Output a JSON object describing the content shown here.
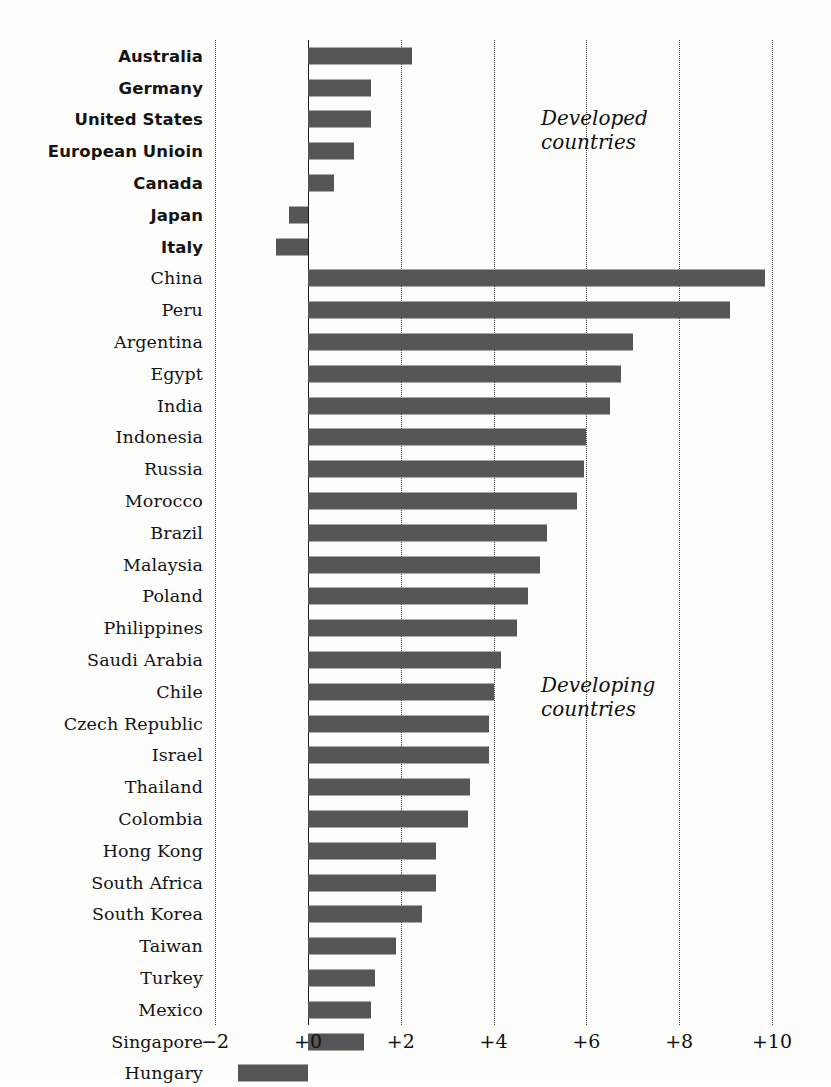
{
  "chart_data": {
    "type": "bar",
    "orientation": "horizontal",
    "title": "",
    "subtitle": "",
    "xlabel": "",
    "ylabel": "",
    "xlim": [
      -2,
      10
    ],
    "xticks": [
      -2,
      0,
      2,
      4,
      6,
      8,
      10
    ],
    "xtick_labels": [
      "−2",
      "+0",
      "+2",
      "+4",
      "+6",
      "+8",
      "+10"
    ],
    "grid": "vertical-dotted",
    "legend": "none",
    "bar_color": "#565656",
    "background_color": "#fdfdfc",
    "axis_color": "#1c1c1c",
    "annotations": [
      {
        "text": "Developed\ncountries",
        "group": "developed"
      },
      {
        "text": "Developing\ncountries",
        "group": "developing"
      }
    ],
    "groups": [
      {
        "name": "developed",
        "label": "Developed countries",
        "bold_labels": true
      },
      {
        "name": "developing",
        "label": "Developing countries",
        "bold_labels": false
      }
    ],
    "categories": [
      "Australia",
      "Germany",
      "United States",
      "European Unioin",
      "Canada",
      "Japan",
      "Italy",
      "China",
      "Peru",
      "Argentina",
      "Egypt",
      "India",
      "Indonesia",
      "Russia",
      "Morocco",
      "Brazil",
      "Malaysia",
      "Poland",
      "Philippines",
      "Saudi Arabia",
      "Chile",
      "Czech Republic",
      "Israel",
      "Thailand",
      "Colombia",
      "Hong Kong",
      "South Africa",
      "South Korea",
      "Taiwan",
      "Turkey",
      "Mexico",
      "Singapore",
      "Hungary"
    ],
    "values": [
      2.25,
      1.35,
      1.35,
      1.0,
      0.55,
      -0.4,
      -0.7,
      9.85,
      9.1,
      7.0,
      6.75,
      6.5,
      6.0,
      5.95,
      5.8,
      5.15,
      5.0,
      4.75,
      4.5,
      4.15,
      4.0,
      3.9,
      3.9,
      3.5,
      3.45,
      2.75,
      2.75,
      2.45,
      1.9,
      1.45,
      1.35,
      1.2,
      -1.5
    ],
    "rows": [
      {
        "label": "Australia",
        "value": 2.25,
        "group": "developed"
      },
      {
        "label": "Germany",
        "value": 1.35,
        "group": "developed"
      },
      {
        "label": "United States",
        "value": 1.35,
        "group": "developed"
      },
      {
        "label": "European Unioin",
        "value": 1.0,
        "group": "developed"
      },
      {
        "label": "Canada",
        "value": 0.55,
        "group": "developed"
      },
      {
        "label": "Japan",
        "value": -0.4,
        "group": "developed"
      },
      {
        "label": "Italy",
        "value": -0.7,
        "group": "developed"
      },
      {
        "label": "China",
        "value": 9.85,
        "group": "developing"
      },
      {
        "label": "Peru",
        "value": 9.1,
        "group": "developing"
      },
      {
        "label": "Argentina",
        "value": 7.0,
        "group": "developing"
      },
      {
        "label": "Egypt",
        "value": 6.75,
        "group": "developing"
      },
      {
        "label": "India",
        "value": 6.5,
        "group": "developing"
      },
      {
        "label": "Indonesia",
        "value": 6.0,
        "group": "developing"
      },
      {
        "label": "Russia",
        "value": 5.95,
        "group": "developing"
      },
      {
        "label": "Morocco",
        "value": 5.8,
        "group": "developing"
      },
      {
        "label": "Brazil",
        "value": 5.15,
        "group": "developing"
      },
      {
        "label": "Malaysia",
        "value": 5.0,
        "group": "developing"
      },
      {
        "label": "Poland",
        "value": 4.75,
        "group": "developing"
      },
      {
        "label": "Philippines",
        "value": 4.5,
        "group": "developing"
      },
      {
        "label": "Saudi Arabia",
        "value": 4.15,
        "group": "developing"
      },
      {
        "label": "Chile",
        "value": 4.0,
        "group": "developing"
      },
      {
        "label": "Czech Republic",
        "value": 3.9,
        "group": "developing"
      },
      {
        "label": "Israel",
        "value": 3.9,
        "group": "developing"
      },
      {
        "label": "Thailand",
        "value": 3.5,
        "group": "developing"
      },
      {
        "label": "Colombia",
        "value": 3.45,
        "group": "developing"
      },
      {
        "label": "Hong Kong",
        "value": 2.75,
        "group": "developing"
      },
      {
        "label": "South Africa",
        "value": 2.75,
        "group": "developing"
      },
      {
        "label": "South Korea",
        "value": 2.45,
        "group": "developing"
      },
      {
        "label": "Taiwan",
        "value": 1.9,
        "group": "developing"
      },
      {
        "label": "Turkey",
        "value": 1.45,
        "group": "developing"
      },
      {
        "label": "Mexico",
        "value": 1.35,
        "group": "developing"
      },
      {
        "label": "Singapore",
        "value": 1.2,
        "group": "developing"
      },
      {
        "label": "Hungary",
        "value": -1.5,
        "group": "developing"
      }
    ]
  },
  "annotations": {
    "developed": "Developed\ncountries",
    "developing": "Developing\ncountries"
  }
}
